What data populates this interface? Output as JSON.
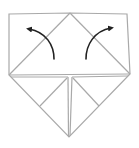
{
  "diagram": {
    "type": "origami-fold-step",
    "colors": {
      "background": "#ffffff",
      "crease_line": "#a9a9a9",
      "arrow": "#222222"
    },
    "outline_points": [
      [
        9,
        14
      ],
      [
        70,
        13
      ],
      [
        127,
        14
      ],
      [
        130,
        74
      ],
      [
        69,
        137
      ],
      [
        9,
        75
      ]
    ],
    "crease_lines": [
      {
        "name": "left-diagonal",
        "from": [
          9,
          75
        ],
        "to": [
          70,
          13
        ]
      },
      {
        "name": "right-diagonal",
        "from": [
          70,
          13
        ],
        "to": [
          130,
          74
        ]
      },
      {
        "name": "middle-horizontal",
        "from": [
          9,
          75
        ],
        "to": [
          130,
          74
        ]
      },
      {
        "name": "center-vertical",
        "from": [
          70,
          76
        ],
        "to": [
          69,
          137
        ]
      },
      {
        "name": "left-inner-diagonal",
        "from": [
          68,
          77
        ],
        "to": [
          40,
          106
        ]
      },
      {
        "name": "right-inner-diagonal",
        "from": [
          72,
          77
        ],
        "to": [
          99,
          106
        ]
      },
      {
        "name": "left-edge-to-center",
        "from": [
          12,
          76
        ],
        "to": [
          68,
          77
        ]
      },
      {
        "name": "right-edge-to-center",
        "from": [
          72,
          77
        ],
        "to": [
          128,
          76
        ]
      }
    ],
    "arrows": [
      {
        "name": "fold-left-arrow",
        "direction": "up-left",
        "start": [
          54,
          59
        ],
        "end": [
          25,
          29
        ]
      },
      {
        "name": "fold-right-arrow",
        "direction": "up-right",
        "start": [
          86,
          59
        ],
        "end": [
          115,
          28
        ]
      }
    ]
  }
}
